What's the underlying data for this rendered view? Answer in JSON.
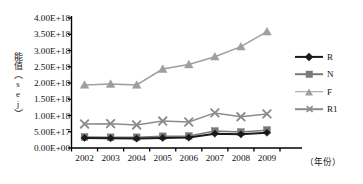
{
  "chart_data": {
    "type": "line",
    "title": "",
    "xlabel": "（年份）",
    "ylabel": "能值（sej）",
    "categories": [
      "2002",
      "2003",
      "2004",
      "2005",
      "2006",
      "2007",
      "2008",
      "2009"
    ],
    "x": [
      2002,
      2003,
      2004,
      2005,
      2006,
      2007,
      2008,
      2009
    ],
    "ylim": [
      0,
      4e+18
    ],
    "ytick_values": [
      4e+18,
      3.5e+18,
      3e+18,
      2.5e+18,
      2e+18,
      1.5e+18,
      1e+18,
      5e+17,
      0
    ],
    "ytick_labels": [
      "4.00E+18",
      "3.50E+18",
      "3.00E+18",
      "2.50E+18",
      "2.00E+18",
      "1.50E+18",
      "1.00E+18",
      "5.00E+17",
      "0.00E+00"
    ],
    "xtick_labels": [
      "2002",
      "2003",
      "2004",
      "2005",
      "2006",
      "2007",
      "2008",
      "2009"
    ],
    "grid": false,
    "legend_position": "right",
    "series": [
      {
        "name": "R",
        "marker": "diamond",
        "color": "#1a1a1a",
        "values": [
          3.1e+17,
          3e+17,
          2.9e+17,
          3.1e+17,
          3.2e+17,
          4.4e+17,
          4.2e+17,
          4.7e+17
        ]
      },
      {
        "name": "N",
        "marker": "square",
        "color": "#7a7a7a",
        "values": [
          3.4e+17,
          3.3e+17,
          3.3e+17,
          3.6e+17,
          3.7e+17,
          5.2e+17,
          4.9e+17,
          5.5e+17
        ]
      },
      {
        "name": "F",
        "marker": "triangle",
        "color": "#9e9e9e",
        "values": [
          1.94e+18,
          1.97e+18,
          1.94e+18,
          2.43e+18,
          2.57e+18,
          2.81e+18,
          3.12e+18,
          3.58e+18
        ]
      },
      {
        "name": "R1",
        "marker": "x",
        "color": "#8c8c8c",
        "values": [
          7.4e+17,
          7.5e+17,
          7.1e+17,
          8.3e+17,
          8e+17,
          1.08e+18,
          9.6e+17,
          1.05e+18
        ]
      }
    ]
  },
  "legend": {
    "items": [
      {
        "label": "R"
      },
      {
        "label": "N"
      },
      {
        "label": "F"
      },
      {
        "label": "R1"
      }
    ]
  },
  "axes": {
    "y_title": "能值（sej）",
    "x_title": "（年份）"
  }
}
